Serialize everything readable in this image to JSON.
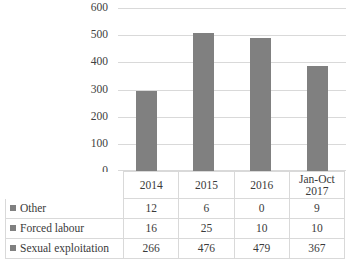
{
  "chart_data": {
    "type": "bar",
    "title": "",
    "xlabel": "",
    "ylabel": "",
    "categories": [
      "2014",
      "2015",
      "2016",
      "Jan-Oct 2017"
    ],
    "category_lines": [
      [
        "2014"
      ],
      [
        "2015"
      ],
      [
        "2016"
      ],
      [
        "Jan-Oct",
        "2017"
      ]
    ],
    "series": [
      {
        "name": "Other",
        "values": [
          12,
          6,
          0,
          9
        ]
      },
      {
        "name": "Forced labour",
        "values": [
          16,
          25,
          10,
          10
        ]
      },
      {
        "name": "Sexual exploitation",
        "values": [
          266,
          476,
          479,
          367
        ]
      }
    ],
    "totals": [
      294,
      507,
      489,
      386
    ],
    "ylim": [
      0,
      600
    ],
    "yticks": [
      600,
      500,
      400,
      300,
      200,
      100,
      0
    ],
    "grid": true,
    "legend_position": "data-table-first-column",
    "has_data_table": true,
    "bar_color": "#808080",
    "gridline_color": "#d9d9d9",
    "table_border_color": "#d9d9d9",
    "text_color": "#3a3a3a"
  }
}
